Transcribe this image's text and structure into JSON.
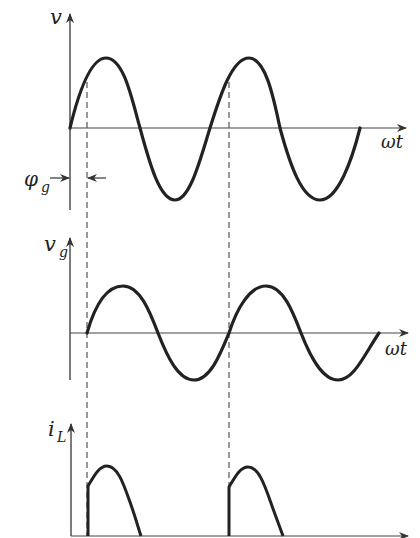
{
  "figure": {
    "panels": [
      {
        "id": "supply-voltage",
        "y_label": "v",
        "x_label": "ωt",
        "annotation": "φg"
      },
      {
        "id": "gate-voltage",
        "y_label": "v",
        "y_label_sub": "g",
        "x_label": "ωt"
      },
      {
        "id": "load-current",
        "y_label": "i",
        "y_label_sub": "L"
      }
    ],
    "phase_label": "φ",
    "phase_label_sub": "g",
    "colors": {
      "curve": "#222222",
      "axis": "#444444",
      "dashed": "#555555"
    }
  }
}
